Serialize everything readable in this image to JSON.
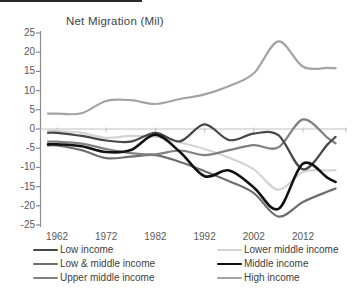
{
  "chart": {
    "title": "Net Migration (Mil)"
  },
  "chart_data": {
    "type": "line",
    "title": "Net Migration (Mil)",
    "xlabel": "",
    "ylabel": "Net migration (millions)",
    "ylim": [
      -25,
      25
    ],
    "y_tick_step": 5,
    "y_tick_labels": [
      "25",
      "20",
      "15",
      "10",
      "5",
      "0",
      "-5",
      "-10",
      "-15",
      "-20",
      "-25"
    ],
    "x_tick_labels": [
      "1962",
      "1972",
      "1982",
      "1992",
      "2002",
      "2012"
    ],
    "x_tick_years": [
      1962,
      1972,
      1982,
      1992,
      2002,
      2012
    ],
    "grid": false,
    "zero_axis_line": true,
    "legend_position": "bottom-two-columns",
    "x": [
      1962,
      1967,
      1972,
      1977,
      1982,
      1987,
      1992,
      1997,
      2002,
      2007,
      2012,
      2017
    ],
    "series": [
      {
        "name": "Low income",
        "color": "#474747",
        "width": 2.2,
        "values": [
          -1.0,
          -1.8,
          -3.0,
          -3.3,
          -1.0,
          -3.2,
          1.2,
          -2.9,
          -1.2,
          -1.6,
          -10.5,
          -4.0
        ]
      },
      {
        "name": "Low & middle income",
        "color": "#6f6f6f",
        "width": 2.2,
        "values": [
          -4.3,
          -5.5,
          -7.6,
          -7.2,
          -6.8,
          -8.6,
          -11.0,
          -13.6,
          -16.7,
          -22.8,
          -19.0,
          -16.3
        ]
      },
      {
        "name": "Upper middle income",
        "color": "#818181",
        "width": 2.2,
        "values": [
          -3.3,
          -3.8,
          -5.2,
          -6.3,
          -6.6,
          -5.6,
          -6.8,
          -5.5,
          -4.2,
          -4.8,
          2.5,
          -2.3
        ]
      },
      {
        "name": "Lower middle income",
        "color": "#d4d4d4",
        "width": 2.2,
        "values": [
          -0.5,
          -1.0,
          -2.3,
          -1.8,
          -2.0,
          -3.5,
          -5.2,
          -7.5,
          -10.5,
          -15.8,
          -11.2,
          -10.8
        ]
      },
      {
        "name": "Middle income",
        "color": "#111111",
        "width": 2.6,
        "values": [
          -4.0,
          -4.5,
          -6.0,
          -5.5,
          -1.5,
          -6.0,
          -12.3,
          -10.8,
          -15.2,
          -20.8,
          -9.0,
          -12.7
        ]
      },
      {
        "name": "High income",
        "color": "#a3a3a3",
        "width": 2.2,
        "values": [
          4.0,
          4.1,
          7.3,
          7.5,
          6.5,
          7.8,
          9.0,
          11.2,
          14.5,
          22.8,
          16.2,
          15.9
        ]
      }
    ],
    "draw_order": [
      3,
      1,
      2,
      5,
      0,
      4
    ],
    "legend_columns": [
      [
        0,
        1,
        2
      ],
      [
        3,
        4,
        5
      ]
    ],
    "axis_color": "#8c8c8c",
    "zero_line_color": "#c0c0c0",
    "tick_label_color": "#595959"
  }
}
